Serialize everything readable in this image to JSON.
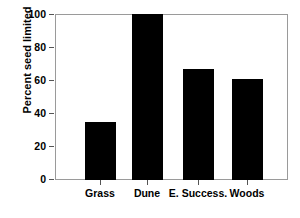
{
  "chart_data": {
    "type": "bar",
    "title": "",
    "subtitle": "",
    "xlabel": "",
    "ylabel": "Percent seed limited",
    "categories": [
      "Grass",
      "Dune",
      "E. Success.",
      "Woods"
    ],
    "values": [
      35,
      100,
      67,
      61
    ],
    "series": [
      {
        "name": "Percent seed limited",
        "values": [
          35,
          100,
          67,
          61
        ]
      }
    ],
    "ylim": [
      0,
      100
    ],
    "yticks": [
      0,
      20,
      40,
      60,
      80,
      100
    ],
    "ytick_labels": [
      "0",
      "20",
      "40",
      "60",
      "80",
      "100"
    ],
    "grid": false,
    "legend": null,
    "legend_position": "none",
    "annotations": [],
    "bar_color": "#000000",
    "frame_color": "#9a9a9a",
    "background_color": "#ffffff",
    "text_color": "#000000"
  },
  "axis": {
    "y_title": "Percent seed limited",
    "y_tick_0": "0",
    "y_tick_1": "20",
    "y_tick_2": "40",
    "y_tick_3": "60",
    "y_tick_4": "80",
    "y_tick_5": "100"
  },
  "categories": {
    "c0": "Grass",
    "c1": "Dune",
    "c2": "E. Success.",
    "c3": "Woods"
  }
}
